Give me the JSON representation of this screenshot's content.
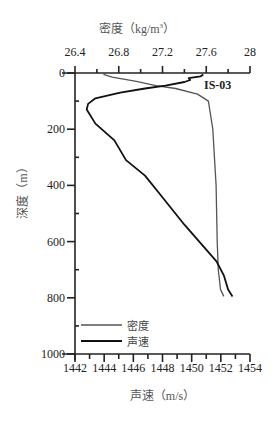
{
  "chart_data": {
    "type": "line",
    "title": "",
    "station_label": "IS-03",
    "x_top_label": "密度（kg/m³）",
    "x_top_label_parts": {
      "main": "密度（kg/m",
      "sup": "3",
      "end": "）"
    },
    "x_bottom_label": "声速（m/s）",
    "y_label": "深度（m）",
    "x_top_ticks": [
      "26.4",
      "26.8",
      "27.2",
      "27.6",
      "28"
    ],
    "x_top_range": [
      26.4,
      28
    ],
    "x_bottom_ticks": [
      "1442",
      "1444",
      "1446",
      "1448",
      "1450",
      "1452",
      "1454"
    ],
    "x_bottom_range": [
      1442,
      1454
    ],
    "y_ticks": [
      "0",
      "200",
      "400",
      "600",
      "800",
      "1000"
    ],
    "y_range": [
      0,
      1000
    ],
    "y_inverted": true,
    "grid": false,
    "legend_position": "lower-left",
    "legend": [
      {
        "name": "密度",
        "style": "gray thin line"
      },
      {
        "name": "声速",
        "style": "black line"
      }
    ],
    "series": [
      {
        "name": "密度",
        "axis": "top",
        "unit": "kg/m³",
        "color": "#555555",
        "points": [
          {
            "depth": 5,
            "value": 26.66
          },
          {
            "depth": 15,
            "value": 26.74
          },
          {
            "depth": 30,
            "value": 26.96
          },
          {
            "depth": 45,
            "value": 27.14
          },
          {
            "depth": 55,
            "value": 27.32
          },
          {
            "depth": 75,
            "value": 27.52
          },
          {
            "depth": 100,
            "value": 27.62
          },
          {
            "depth": 200,
            "value": 27.66
          },
          {
            "depth": 400,
            "value": 27.69
          },
          {
            "depth": 600,
            "value": 27.7
          },
          {
            "depth": 700,
            "value": 27.71
          },
          {
            "depth": 770,
            "value": 27.73
          },
          {
            "depth": 795,
            "value": 27.76
          }
        ]
      },
      {
        "name": "声速",
        "axis": "bottom",
        "unit": "m/s",
        "color": "#111111",
        "points": [
          {
            "depth": 5,
            "value": 1450.8
          },
          {
            "depth": 12,
            "value": 1450.6
          },
          {
            "depth": 18,
            "value": 1449.8
          },
          {
            "depth": 25,
            "value": 1449.9
          },
          {
            "depth": 32,
            "value": 1449.5
          },
          {
            "depth": 45,
            "value": 1448.2
          },
          {
            "depth": 55,
            "value": 1446.8
          },
          {
            "depth": 70,
            "value": 1445.1
          },
          {
            "depth": 90,
            "value": 1443.4
          },
          {
            "depth": 110,
            "value": 1442.9
          },
          {
            "depth": 130,
            "value": 1442.8
          },
          {
            "depth": 180,
            "value": 1443.4
          },
          {
            "depth": 240,
            "value": 1444.7
          },
          {
            "depth": 310,
            "value": 1445.5
          },
          {
            "depth": 365,
            "value": 1446.8
          },
          {
            "depth": 430,
            "value": 1447.8
          },
          {
            "depth": 540,
            "value": 1449.5
          },
          {
            "depth": 670,
            "value": 1451.7
          },
          {
            "depth": 720,
            "value": 1452.2
          },
          {
            "depth": 770,
            "value": 1452.5
          },
          {
            "depth": 795,
            "value": 1452.8
          }
        ]
      }
    ]
  }
}
